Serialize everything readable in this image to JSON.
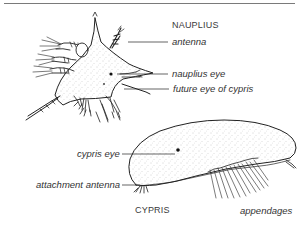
{
  "figure": {
    "stages": [
      {
        "name": "NAUPLIUS",
        "labels": {
          "antenna": "antenna",
          "nauplius_eye": "nauplius eye",
          "future_eye": "future eye of cypris"
        }
      },
      {
        "name": "CYPRIS",
        "labels": {
          "cypris_eye": "cypris eye",
          "attachment_antenna": "attachment antenna",
          "appendages": "appendages"
        }
      }
    ],
    "colors": {
      "ink": "#222222",
      "text": "#333333",
      "rule": "#7a7a7a",
      "shading": "#9a9a9a",
      "background": "#ffffff"
    }
  }
}
